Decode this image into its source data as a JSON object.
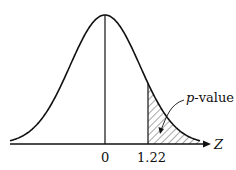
{
  "diagram": {
    "type": "normal-distribution-curve",
    "axis_label": "Z",
    "tick_labels": [
      "0",
      "1.22"
    ],
    "annotation": {
      "italic": "p",
      "text": "-value"
    },
    "shaded_region": "right tail beyond z = 1.22",
    "colors": {
      "stroke": "#111111",
      "background": "#ffffff"
    }
  }
}
